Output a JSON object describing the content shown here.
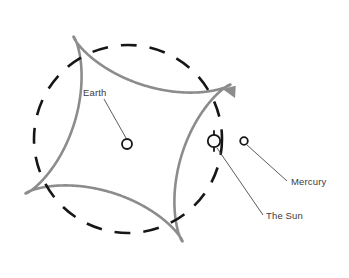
{
  "diagram": {
    "type": "astronomical-orbit-diagram",
    "background_color": "#ffffff",
    "colors": {
      "epitrochoid": "#8c8c8c",
      "dashed_orbit": "#161616",
      "body_outline": "#161616",
      "leader_line": "#4a4a4a",
      "label_text": "#3b3b3b"
    },
    "labels": {
      "earth": "Earth",
      "sun": "The Sun",
      "mercury": "Mercury"
    },
    "bodies": [
      {
        "name": "Earth",
        "cx": 127,
        "cy": 144,
        "r": 5.0,
        "symbol": "open-circle"
      },
      {
        "name": "The Sun",
        "cx": 214,
        "cy": 141,
        "r": 6.2,
        "symbol": "circle-with-ticks"
      },
      {
        "name": "Mercury",
        "cx": 244,
        "cy": 141,
        "r": 3.8,
        "symbol": "open-circle"
      }
    ],
    "leader_lines": [
      {
        "for": "Earth",
        "x1": 104,
        "y1": 99,
        "x2": 126,
        "y2": 138
      },
      {
        "for": "The Sun",
        "x1": 217,
        "y1": 148,
        "x2": 263,
        "y2": 215
      },
      {
        "for": "Mercury",
        "x1": 247,
        "y1": 145,
        "x2": 287,
        "y2": 181
      }
    ],
    "label_positions": [
      {
        "text_key": "earth",
        "x": 83,
        "y": 96,
        "anchor": "start"
      },
      {
        "text_key": "sun",
        "x": 266,
        "y": 219,
        "anchor": "start"
      },
      {
        "text_key": "mercury",
        "x": 291,
        "y": 185,
        "anchor": "start"
      }
    ],
    "dashed_orbit": {
      "label": "Sun's apparent orbit around the Earth",
      "cx": 128,
      "cy": 139,
      "r": 94,
      "dash_pattern": "16 13",
      "stroke_width": 2.6
    },
    "epitrochoid": {
      "label": "Mercury's looping geocentric path",
      "center_x": 128,
      "center_y": 139,
      "big_radius": 86,
      "small_radius": 30,
      "loops": 3,
      "rotation_deg": -28,
      "stroke_width": 2.6,
      "loop_centers": [
        {
          "x": 166,
          "y": 72
        },
        {
          "x": 45,
          "y": 136
        },
        {
          "x": 151,
          "y": 206
        }
      ]
    },
    "arrow": {
      "label": "direction-of-motion",
      "tip_x": 235,
      "tip_y": 98,
      "angle_deg": 62,
      "size": 11
    }
  }
}
